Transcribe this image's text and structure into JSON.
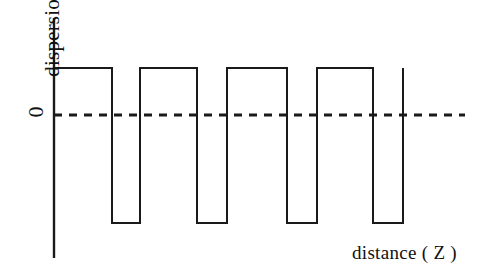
{
  "figure": {
    "background_color": "#ffffff",
    "line_color": "#1a1a1a",
    "ylabel": "dispersion",
    "ytick_zero": "0",
    "xlabel": "distance ( Z )"
  },
  "chart_data": {
    "type": "line",
    "title": "",
    "subtitle": "",
    "xlabel": "distance ( Z )",
    "ylabel": "dispersion",
    "grid": false,
    "legend": null,
    "xlim": [
      0,
      1
    ],
    "ylim": [
      -1.35,
      1.35
    ],
    "xtick_labels": [],
    "ytick_labels": [
      "0"
    ],
    "levels": {
      "high": 1.0,
      "zero": 0.0,
      "low": -1.3
    },
    "zero_line": {
      "value": 0,
      "style": "dashed",
      "dash": "8,7",
      "width": 3
    },
    "series": [
      {
        "name": "dispersion(Z)",
        "style": "step",
        "line_width": 2,
        "x": [
          54,
          112,
          112,
          140,
          140,
          197,
          197,
          227,
          227,
          287,
          287,
          317,
          317,
          373,
          373,
          403,
          403
        ],
        "y": [
          1.0,
          1.0,
          -1.3,
          -1.3,
          1.0,
          1.0,
          -1.3,
          -1.3,
          1.0,
          1.0,
          -1.3,
          -1.3,
          1.0,
          1.0,
          -1.3,
          -1.3,
          1.0
        ],
        "segments": [
          {
            "type": "high",
            "x_start": 54,
            "x_end": 112
          },
          {
            "type": "low",
            "x_start": 112,
            "x_end": 140
          },
          {
            "type": "high",
            "x_start": 140,
            "x_end": 197
          },
          {
            "type": "low",
            "x_start": 197,
            "x_end": 227
          },
          {
            "type": "high",
            "x_start": 227,
            "x_end": 287
          },
          {
            "type": "low",
            "x_start": 287,
            "x_end": 317
          },
          {
            "type": "high",
            "x_start": 317,
            "x_end": 373
          },
          {
            "type": "low",
            "x_start": 373,
            "x_end": 403
          }
        ],
        "period_count": 4,
        "duty_cycle": "approx 2:1 high:low"
      }
    ],
    "axes": {
      "y_axis": {
        "x": 54,
        "y_top": 18,
        "y_bottom": 258,
        "visible": true
      },
      "x_axis": {
        "visible": false
      },
      "zero_dashed_line": {
        "x_start": 54,
        "x_end": 465,
        "y": 115
      }
    }
  }
}
